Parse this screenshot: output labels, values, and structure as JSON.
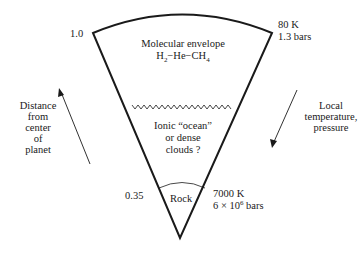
{
  "diagram": {
    "outer_radius_label": "1.0",
    "rock_radius_label": "0.35",
    "outer_conditions": {
      "temperature": "80 K",
      "pressure": "1.3 bars"
    },
    "inner_conditions": {
      "temperature": "7000 K",
      "pressure_prefix": "6 × 10",
      "pressure_exp": "6",
      "pressure_unit": " bars"
    },
    "layers": {
      "envelope": {
        "line1": "Molecular envelope",
        "formula": [
          "H",
          "2",
          "−He−CH",
          "4"
        ]
      },
      "ocean": {
        "line1": "Ionic “ocean”",
        "line2": "or dense",
        "line3": "clouds ?"
      },
      "core": {
        "label": "Rock"
      }
    },
    "left_axis": {
      "lines": [
        "Distance",
        "from",
        "center",
        "of",
        "planet"
      ],
      "direction": "up"
    },
    "right_axis": {
      "lines": [
        "Local",
        "temperature,",
        "pressure"
      ],
      "direction": "down"
    },
    "colors": {
      "line": "#1a1a1a",
      "background": "#ffffff"
    }
  }
}
